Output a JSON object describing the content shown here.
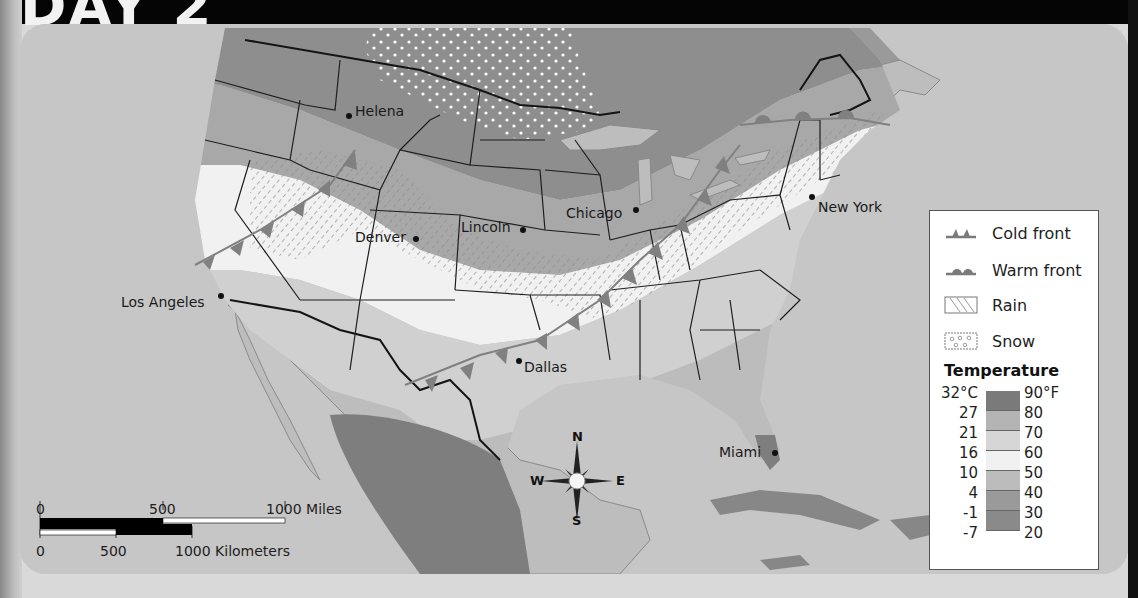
{
  "page": {
    "title": "DAY 2"
  },
  "map": {
    "cities": [
      {
        "name": "Helena",
        "x": 349,
        "y": 116
      },
      {
        "name": "Lincoln",
        "x": 523,
        "y": 230
      },
      {
        "name": "Chicago",
        "x": 636,
        "y": 210
      },
      {
        "name": "New York",
        "x": 812,
        "y": 197
      },
      {
        "name": "Denver",
        "x": 416,
        "y": 239
      },
      {
        "name": "Los Angeles",
        "x": 221,
        "y": 296
      },
      {
        "name": "Dallas",
        "x": 519,
        "y": 361
      },
      {
        "name": "Miami",
        "x": 775,
        "y": 453
      }
    ],
    "labels": {
      "helena": "Helena",
      "lincoln": "Lincoln",
      "chicago": "Chicago",
      "new_york": "New York",
      "denver": "Denver",
      "los_angeles": "Los Angeles",
      "dallas": "Dallas",
      "miami": "Miami"
    }
  },
  "compass": {
    "n": "N",
    "s": "S",
    "e": "E",
    "w": "W"
  },
  "scale_bar": {
    "miles": {
      "zero": "0",
      "mid": "500",
      "end": "1000 Miles"
    },
    "kilometers": {
      "zero": "0",
      "mid": "500",
      "end": "1000 Kilometers"
    }
  },
  "legend": {
    "items": [
      {
        "symbol": "cold-front",
        "label": "Cold front"
      },
      {
        "symbol": "warm-front",
        "label": "Warm front"
      },
      {
        "symbol": "rain",
        "label": "Rain"
      },
      {
        "symbol": "snow",
        "label": "Snow"
      }
    ],
    "temperature_heading": "Temperature",
    "celsius": [
      "32°C",
      "27",
      "21",
      "16",
      "10",
      "4",
      "-1",
      "-7"
    ],
    "fahrenheit": [
      "90°F",
      "80",
      "70",
      "60",
      "50",
      "40",
      "30",
      "20"
    ],
    "ramp_colors": [
      "#7a7a7a",
      "#b4b4b4",
      "#d6d6d6",
      "#f1f1f1",
      "#bcbcbc",
      "#9a9a9a",
      "#8a8a8a"
    ]
  },
  "colors": {
    "ocean": "#c6c6c6",
    "land_base": "#c0c0c0",
    "band_coldest": "#8c8c8c",
    "band_cold": "#9d9d9d",
    "band_cool": "#bcbcbc",
    "band_mild": "#f2f2f2",
    "band_warm": "#d3d3d3",
    "band_warmer": "#b6b6b6",
    "band_hot": "#7c7c7c",
    "front": "#808080",
    "border": "#141414"
  }
}
